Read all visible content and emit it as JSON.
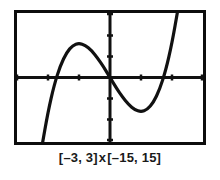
{
  "figure": {
    "caption": "[–3, 3] x [–15, 15]",
    "caption_x_range": "[–3, 3]",
    "caption_separator": "x",
    "caption_y_range": "[–15, 15]",
    "screen_border_color": "#0d0d0d",
    "screen_background_color": "#ffffff",
    "curve_color": "#111111",
    "axis_color": "#111111"
  },
  "chart_data": {
    "type": "line",
    "title": "",
    "subtitle": "",
    "xlabel": "",
    "ylabel": "",
    "xlim": [
      -3,
      3
    ],
    "ylim": [
      -15,
      15
    ],
    "xtick_interval": 1,
    "ytick_interval": 5,
    "xticks": [
      -3,
      -2,
      -1,
      0,
      1,
      2,
      3
    ],
    "yticks": [
      -15,
      -10,
      -5,
      0,
      5,
      10,
      15
    ],
    "xtick_labels": [],
    "ytick_labels": [],
    "grid": false,
    "legend": false,
    "legend_position": "none",
    "axes_style": "calculator-screen",
    "annotations": [],
    "series": [
      {
        "name": "y = 4x³ – 12x",
        "x": [
          -3.0,
          -2.8,
          -2.6,
          -2.4,
          -2.2,
          -2.0,
          -1.8,
          -1.6,
          -1.4,
          -1.2,
          -1.0,
          -0.8,
          -0.6,
          -0.4,
          -0.2,
          0.0,
          0.2,
          0.4,
          0.6,
          0.8,
          1.0,
          1.2,
          1.4,
          1.6,
          1.8,
          2.0,
          2.2,
          2.4,
          2.6,
          2.8,
          3.0
        ],
        "y": [
          -72.0,
          -54.2,
          -40.2,
          -26.1,
          -16.2,
          -8.0,
          -1.7,
          2.8,
          5.8,
          7.5,
          8.0,
          7.5,
          6.3,
          4.5,
          2.4,
          0.0,
          -2.4,
          -4.5,
          -6.3,
          -7.5,
          -8.0,
          -7.5,
          -5.8,
          -2.8,
          1.7,
          8.0,
          16.2,
          26.1,
          40.2,
          54.2,
          72.0
        ],
        "local_maximum": {
          "x": -1.0,
          "y": 8.0
        },
        "local_minimum": {
          "x": 1.0,
          "y": -8.0
        },
        "x_intercepts": [
          -1.732,
          0.0,
          1.732
        ],
        "y_intercept": 0.0
      }
    ]
  }
}
